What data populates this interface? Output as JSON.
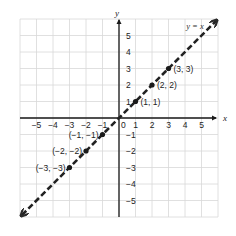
{
  "chart_data": {
    "type": "line",
    "title": "",
    "xlabel": "x",
    "ylabel": "y",
    "xlim": [
      -6,
      6
    ],
    "ylim": [
      -6,
      6
    ],
    "grid": true,
    "x_ticks": [
      -5,
      -4,
      -3,
      -2,
      -1,
      1,
      2,
      3,
      4,
      5
    ],
    "y_ticks": [
      -5,
      -4,
      -3,
      -2,
      -1,
      1,
      2,
      3,
      4,
      5
    ],
    "x_tick_labels": [
      "−5",
      "−4",
      "−3",
      "−2",
      "−1",
      "1",
      "2",
      "3",
      "4",
      "5"
    ],
    "y_tick_labels": [
      "−5",
      "−4",
      "−3",
      "−2",
      "−1",
      "1",
      "2",
      "3",
      "4",
      "5"
    ],
    "origin_label": "0",
    "series": [
      {
        "name": "y = x",
        "style": "dashed",
        "color": "#222222",
        "arrows": "both",
        "x": [
          -6,
          6
        ],
        "y": [
          -6,
          6
        ]
      }
    ],
    "points": [
      {
        "x": 1,
        "y": 1,
        "label": "(1, 1)"
      },
      {
        "x": 2,
        "y": 2,
        "label": "(2, 2)"
      },
      {
        "x": 3,
        "y": 3,
        "label": "(3, 3)"
      },
      {
        "x": -1,
        "y": -1,
        "label": "(−1, −1)"
      },
      {
        "x": -2,
        "y": -2,
        "label": "(−2, −2)"
      },
      {
        "x": -3,
        "y": -3,
        "label": "(−3, −3)"
      }
    ],
    "annotations": [
      {
        "text": "y = x",
        "x": 4.6,
        "y": 5.6
      }
    ]
  },
  "colors": {
    "grid": "#d8d8d8",
    "axis": "#1a1a1a",
    "line": "#2a2a2a",
    "point": "#1a1a1a"
  }
}
